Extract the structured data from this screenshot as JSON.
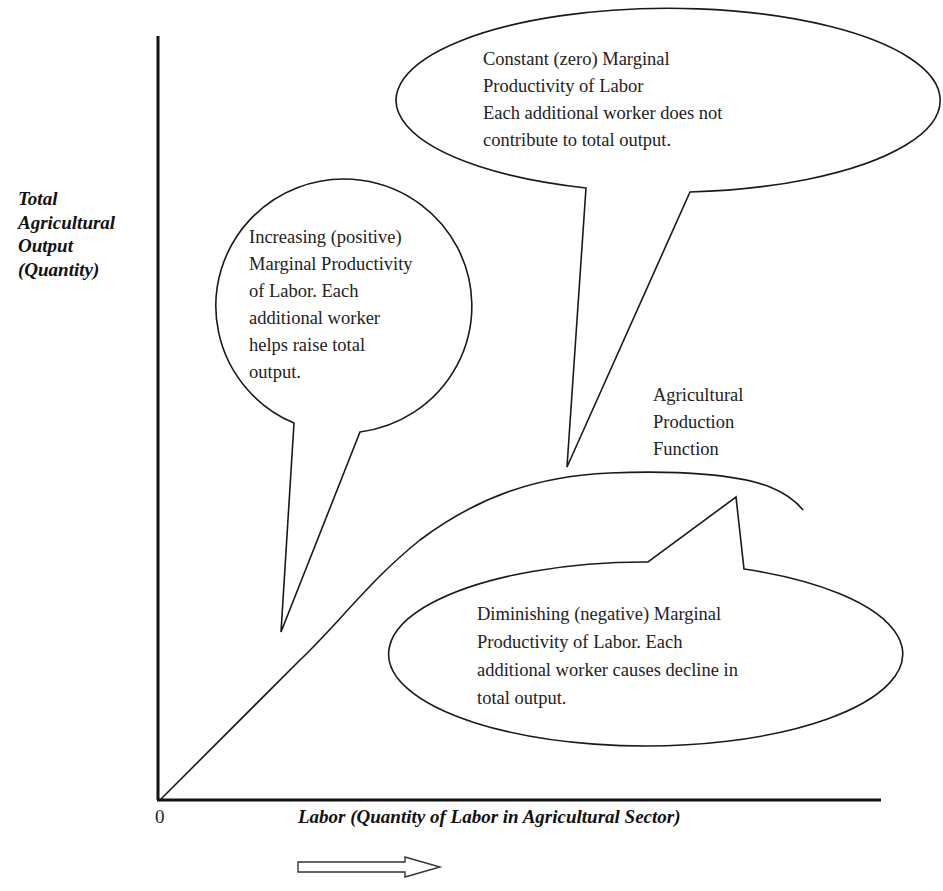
{
  "diagram": {
    "axes": {
      "y_label_lines": [
        "Total",
        "Agricultural",
        "Output",
        "(Quantity)"
      ],
      "x_label": "Labor (Quantity of Labor in Agricultural Sector)",
      "origin_label": "0"
    },
    "curve_label_lines": [
      "Agricultural",
      "Production",
      "Function"
    ],
    "callouts": {
      "constant": {
        "lines": [
          "Constant (zero) Marginal",
          "Productivity of Labor",
          "Each additional worker does not",
          "contribute to total output."
        ]
      },
      "increasing": {
        "lines": [
          "Increasing (positive)",
          "Marginal Productivity",
          "of Labor. Each",
          "additional worker",
          "helps raise total",
          "output."
        ]
      },
      "diminishing": {
        "lines": [
          "Diminishing (negative) Marginal",
          "Productivity of Labor. Each",
          "additional worker causes decline in",
          "total output."
        ]
      }
    },
    "direction_arrow": "right-arrow-icon",
    "colors": {
      "line": "#1a1a1a",
      "background": "#ffffff",
      "text": "#222222"
    }
  }
}
